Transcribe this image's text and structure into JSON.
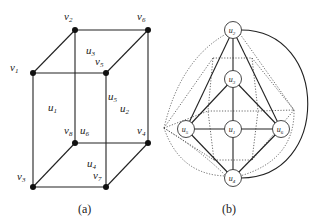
{
  "figure_a": {
    "caption": "(a)",
    "vertices": [
      {
        "id": "v1",
        "base": "v",
        "sub": "1",
        "x": 33,
        "y": 73,
        "lx": 10,
        "ly": 71
      },
      {
        "id": "v2",
        "base": "v",
        "sub": "2",
        "x": 75,
        "y": 30,
        "lx": 64,
        "ly": 20
      },
      {
        "id": "v3",
        "base": "v",
        "sub": "3",
        "x": 33,
        "y": 187,
        "lx": 17,
        "ly": 180
      },
      {
        "id": "v4",
        "base": "v",
        "sub": "4",
        "x": 148,
        "y": 143,
        "lx": 137,
        "ly": 134
      },
      {
        "id": "v5",
        "base": "v",
        "sub": "5",
        "x": 106,
        "y": 73,
        "lx": 95,
        "ly": 65
      },
      {
        "id": "v6",
        "base": "v",
        "sub": "6",
        "x": 148,
        "y": 30,
        "lx": 137,
        "ly": 20
      },
      {
        "id": "v7",
        "base": "v",
        "sub": "7",
        "x": 106,
        "y": 187,
        "lx": 93,
        "ly": 179
      },
      {
        "id": "v8",
        "base": "v",
        "sub": "8",
        "x": 75,
        "y": 143,
        "lx": 64,
        "ly": 134
      }
    ],
    "faces": [
      {
        "id": "u1",
        "base": "u",
        "sub": "1",
        "lx": 48,
        "ly": 111
      },
      {
        "id": "u2",
        "base": "u",
        "sub": "2",
        "lx": 120,
        "ly": 112
      },
      {
        "id": "u3",
        "base": "u",
        "sub": "3",
        "lx": 86,
        "ly": 54
      },
      {
        "id": "u4",
        "base": "u",
        "sub": "4",
        "lx": 87,
        "ly": 167
      },
      {
        "id": "u5",
        "base": "u",
        "sub": "5",
        "lx": 108,
        "ly": 100
      },
      {
        "id": "u6",
        "base": "u",
        "sub": "6",
        "lx": 80,
        "ly": 134
      }
    ],
    "edges": [
      [
        "v1",
        "v5"
      ],
      [
        "v1",
        "v2"
      ],
      [
        "v2",
        "v6"
      ],
      [
        "v5",
        "v6"
      ],
      [
        "v1",
        "v3"
      ],
      [
        "v5",
        "v7"
      ],
      [
        "v6",
        "v4"
      ],
      [
        "v2",
        "v8"
      ],
      [
        "v3",
        "v7"
      ],
      [
        "v8",
        "v4"
      ],
      [
        "v3",
        "v8"
      ],
      [
        "v7",
        "v4"
      ]
    ]
  },
  "figure_b": {
    "caption": "(b)",
    "nodes": [
      {
        "id": "u1",
        "base": "u",
        "sub": "1",
        "x": 233,
        "y": 129
      },
      {
        "id": "u2",
        "base": "u",
        "sub": "2",
        "x": 233,
        "y": 30
      },
      {
        "id": "u3",
        "base": "u",
        "sub": "3",
        "x": 233,
        "y": 79
      },
      {
        "id": "u4",
        "base": "u",
        "sub": "4",
        "x": 233,
        "y": 178
      },
      {
        "id": "u5",
        "base": "u",
        "sub": "5",
        "x": 186,
        "y": 129
      },
      {
        "id": "u6",
        "base": "u",
        "sub": "6",
        "x": 281,
        "y": 129
      }
    ],
    "solid_edges": [
      [
        "u2",
        "u3"
      ],
      [
        "u2",
        "u5"
      ],
      [
        "u2",
        "u6"
      ],
      [
        "u3",
        "u5"
      ],
      [
        "u3",
        "u6"
      ],
      [
        "u3",
        "u1"
      ],
      [
        "u5",
        "u1"
      ],
      [
        "u1",
        "u6"
      ],
      [
        "u1",
        "u4"
      ],
      [
        "u5",
        "u4"
      ],
      [
        "u6",
        "u4"
      ]
    ],
    "curved_edge": {
      "from": "u2",
      "to": "u4",
      "path": "M 241 30 C 330 30, 330 178, 241 178"
    },
    "dual_vertices": {
      "v1": [
        164,
        128
      ],
      "v2": [
        213,
        58
      ],
      "v3": [
        214,
        160
      ],
      "v4": [
        294,
        110
      ],
      "v5": [
        208,
        111
      ],
      "v6": [
        252,
        58
      ],
      "v7": [
        252,
        160
      ],
      "v8": [
        258,
        111
      ]
    },
    "dual_edges_note": "dotted cube-graph dual edges crossing each solid edge",
    "node_radius": 8.5
  }
}
